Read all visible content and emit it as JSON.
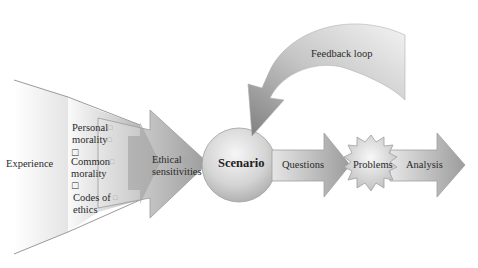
{
  "diagram": {
    "type": "flow",
    "nodes": {
      "experience": "Experience",
      "funnel_items": [
        {
          "line1": "Personal",
          "line2": "morality"
        },
        {
          "line1": "Common",
          "line2": "morality"
        },
        {
          "line1": "Codes of",
          "line2": "ethics"
        }
      ],
      "ethical_sensitivities": {
        "line1": "Ethical",
        "line2": "sensitivities"
      },
      "scenario": "Scenario",
      "questions": "Questions",
      "problems": "Problems",
      "analysis": "Analysis",
      "feedback": "Feedback loop"
    },
    "placeholder_glyph": "□",
    "edges": [
      {
        "from": "Experience",
        "to": "Ethical sensitivities"
      },
      {
        "from": "Ethical sensitivities",
        "to": "Scenario"
      },
      {
        "from": "Scenario",
        "to": "Questions"
      },
      {
        "from": "Questions",
        "to": "Problems"
      },
      {
        "from": "Problems",
        "to": "Analysis"
      },
      {
        "from": "Analysis",
        "to": "Scenario",
        "label": "Feedback loop"
      }
    ],
    "colors": {
      "fill_light": "#f2f2f2",
      "fill_mid": "#c8c8c8",
      "fill_dark": "#8a8a8a",
      "stroke": "#9a9a9a",
      "text": "#2a2a2a"
    }
  }
}
